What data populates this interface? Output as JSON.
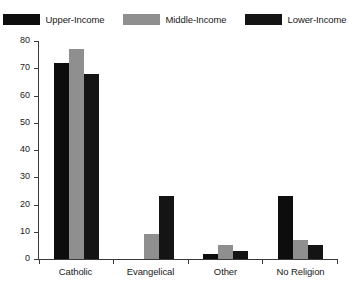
{
  "chart_data": {
    "type": "bar",
    "title": "",
    "subtitle": "",
    "xlabel": "",
    "ylabel": "",
    "categories": [
      "Catholic",
      "Evangelical",
      "Other",
      "No Religion"
    ],
    "series": [
      {
        "name": "Upper-Income",
        "color": "#0d0d0d",
        "values": [
          72,
          0,
          2,
          23
        ]
      },
      {
        "name": "Middle-Income",
        "color": "#8f8f8f",
        "values": [
          77,
          9,
          5,
          7
        ]
      },
      {
        "name": "Lower-Income",
        "color": "#141414",
        "values": [
          68,
          23,
          3,
          5
        ]
      }
    ],
    "ylim": [
      0,
      80
    ],
    "yticks": [
      0,
      10,
      20,
      30,
      40,
      50,
      60,
      70,
      80
    ],
    "ytick_labels": [
      "0",
      "10",
      "20",
      "30",
      "40",
      "50",
      "60",
      "70",
      "80"
    ],
    "grid": false,
    "legend_position": "top"
  },
  "legend": {
    "entries": [
      {
        "label": "Upper-Income",
        "color": "#0d0d0d"
      },
      {
        "label": "Middle-Income",
        "color": "#8f8f8f"
      },
      {
        "label": "Lower-Income",
        "color": "#141414"
      }
    ]
  },
  "axes": {
    "axis_color": "#3a3a3a",
    "background": "#ffffff"
  }
}
